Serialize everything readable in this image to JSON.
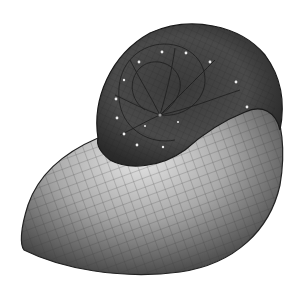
{
  "image": {
    "subject": "Nautilus shell 3D mesh rendering",
    "description": "Grayscale rendering of a logarithmic-spiral nautilus shell with a wireframe grid overlaid on its surface",
    "colors": {
      "background": "#ffffff",
      "shell_dark": "#2a2a2a",
      "shell_mid": "#6e6e6e",
      "shell_light": "#d9d9d9",
      "grid": "#3a3a3a",
      "highlight_dots": "#f0f0f0"
    }
  }
}
